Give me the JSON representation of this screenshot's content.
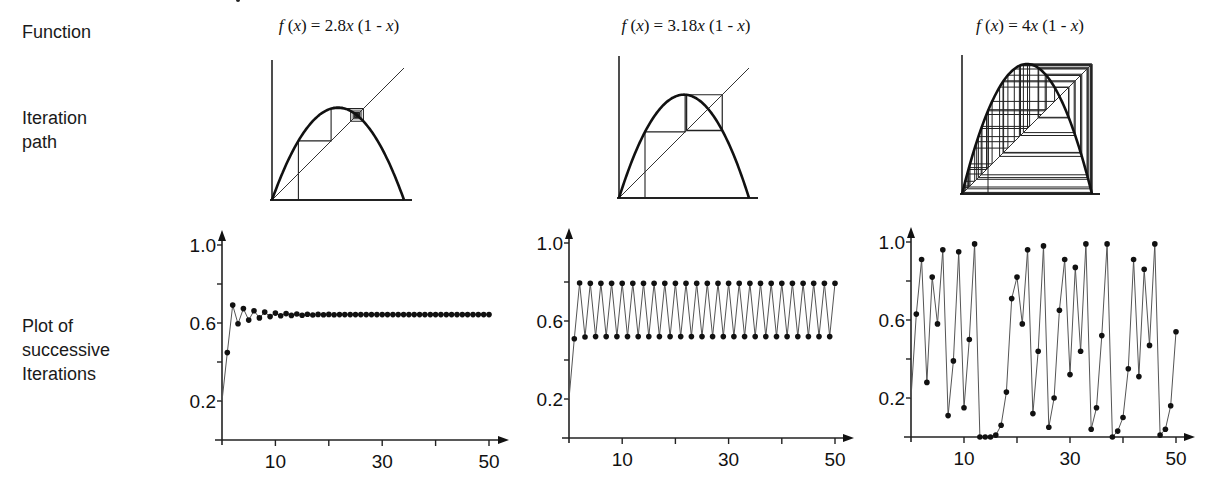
{
  "row_labels": {
    "function": "Function",
    "iteration_path": [
      "Iteration",
      "path"
    ],
    "successive_plot": [
      "Plot of",
      "successive",
      "Iterations"
    ]
  },
  "columns": [
    {
      "formula_prefix": "f (x) = ",
      "formula_coef": "2.8",
      "formula_suffix": "x (1 - x)",
      "r": 2.8
    },
    {
      "formula_prefix": "f (x) = ",
      "formula_coef": "3.18",
      "formula_suffix": "x (1 - x)",
      "r": 3.18
    },
    {
      "formula_prefix": "f (x) = ",
      "formula_coef": "4",
      "formula_suffix": "x (1 - x)",
      "r": 4
    }
  ],
  "chart_data": [
    {
      "type": "line",
      "title": "f(x) = 2.8x (1 - x)",
      "xlabel": "",
      "ylabel": "",
      "x": [
        0,
        1,
        2,
        3,
        4,
        5,
        6,
        7,
        8,
        9,
        10,
        11,
        12,
        13,
        14,
        15,
        16,
        17,
        18,
        19,
        20,
        21,
        22,
        23,
        24,
        25,
        26,
        27,
        28,
        29,
        30,
        31,
        32,
        33,
        34,
        35,
        36,
        37,
        38,
        39,
        40,
        41,
        42,
        43,
        44,
        45,
        46,
        47,
        48,
        49,
        50
      ],
      "values": [
        0.2,
        0.448,
        0.692,
        0.596,
        0.674,
        0.615,
        0.663,
        0.626,
        0.656,
        0.633,
        0.651,
        0.637,
        0.648,
        0.639,
        0.646,
        0.64,
        0.645,
        0.641,
        0.644,
        0.642,
        0.644,
        0.642,
        0.643,
        0.643,
        0.643,
        0.643,
        0.643,
        0.643,
        0.643,
        0.643,
        0.643,
        0.643,
        0.643,
        0.643,
        0.643,
        0.643,
        0.643,
        0.643,
        0.643,
        0.643,
        0.643,
        0.643,
        0.643,
        0.643,
        0.643,
        0.643,
        0.643,
        0.643,
        0.643,
        0.643,
        0.643
      ],
      "x_ticks": [
        10,
        20,
        30,
        40,
        50
      ],
      "x_tick_labels": [
        "10",
        "30",
        "50"
      ],
      "y_ticks": [
        0.2,
        0.4,
        0.6,
        0.8,
        1.0
      ],
      "y_tick_labels": [
        "0.2",
        "0.6",
        "1.0"
      ],
      "xlim": [
        0,
        50
      ],
      "ylim": [
        0,
        1.0
      ],
      "grid": false,
      "markers": true
    },
    {
      "type": "line",
      "title": "f(x) = 3.18x (1 - x)",
      "xlabel": "",
      "ylabel": "",
      "x": [
        0,
        1,
        2,
        3,
        4,
        5,
        6,
        7,
        8,
        9,
        10,
        11,
        12,
        13,
        14,
        15,
        16,
        17,
        18,
        19,
        20,
        21,
        22,
        23,
        24,
        25,
        26,
        27,
        28,
        29,
        30,
        31,
        32,
        33,
        34,
        35,
        36,
        37,
        38,
        39,
        40,
        41,
        42,
        43,
        44,
        45,
        46,
        47,
        48,
        49,
        50
      ],
      "values": [
        0.2,
        0.509,
        0.795,
        0.518,
        0.794,
        0.52,
        0.794,
        0.52,
        0.794,
        0.52,
        0.794,
        0.52,
        0.794,
        0.52,
        0.794,
        0.52,
        0.794,
        0.52,
        0.794,
        0.52,
        0.794,
        0.52,
        0.794,
        0.52,
        0.794,
        0.52,
        0.794,
        0.52,
        0.794,
        0.52,
        0.794,
        0.52,
        0.794,
        0.52,
        0.794,
        0.52,
        0.794,
        0.52,
        0.794,
        0.52,
        0.794,
        0.52,
        0.794,
        0.52,
        0.794,
        0.52,
        0.794,
        0.52,
        0.794,
        0.52,
        0.794
      ],
      "x_ticks": [
        10,
        20,
        30,
        40,
        50
      ],
      "x_tick_labels": [
        "10",
        "30",
        "50"
      ],
      "y_ticks": [
        0.2,
        0.4,
        0.6,
        0.8,
        1.0
      ],
      "y_tick_labels": [
        "0.2",
        "0.6",
        "1.0"
      ],
      "xlim": [
        0,
        50
      ],
      "ylim": [
        0,
        1.0
      ],
      "grid": false,
      "markers": true
    },
    {
      "type": "line",
      "title": "f(x) = 4x (1 - x)",
      "xlabel": "",
      "ylabel": "",
      "x": [
        0,
        1,
        2,
        3,
        4,
        5,
        6,
        7,
        8,
        9,
        10,
        11,
        12,
        13,
        14,
        15,
        16,
        17,
        18,
        19,
        20,
        21,
        22,
        23,
        24,
        25,
        26,
        27,
        28,
        29,
        30,
        31,
        32,
        33,
        34,
        35,
        36,
        37,
        38,
        39,
        40,
        41,
        42,
        43,
        44,
        45,
        46,
        47,
        48,
        49,
        50
      ],
      "values": [
        0.2,
        0.63,
        0.91,
        0.28,
        0.82,
        0.58,
        0.96,
        0.11,
        0.39,
        0.95,
        0.15,
        0.5,
        0.99,
        0.0,
        0.0,
        0.0,
        0.01,
        0.06,
        0.23,
        0.71,
        0.82,
        0.58,
        0.96,
        0.12,
        0.44,
        0.98,
        0.05,
        0.2,
        0.65,
        0.91,
        0.32,
        0.87,
        0.44,
        0.99,
        0.04,
        0.15,
        0.52,
        0.99,
        0.0,
        0.03,
        0.1,
        0.35,
        0.91,
        0.31,
        0.86,
        0.47,
        0.99,
        0.01,
        0.04,
        0.16,
        0.54
      ],
      "x_ticks": [
        10,
        20,
        30,
        40,
        50
      ],
      "x_tick_labels": [
        "10",
        "30",
        "50"
      ],
      "y_ticks": [
        0.2,
        0.4,
        0.6,
        0.8,
        1.0
      ],
      "y_tick_labels": [
        "0.2",
        "0.6",
        "1.0"
      ],
      "xlim": [
        0,
        50
      ],
      "ylim": [
        0,
        1.0
      ],
      "grid": false,
      "markers": true
    }
  ],
  "iteration_paths": [
    {
      "r": 2.8,
      "x0": 0.2,
      "steps": 40
    },
    {
      "r": 3.18,
      "x0": 0.2,
      "steps": 40
    },
    {
      "r": 4,
      "x0": 0.2,
      "steps": 50
    }
  ]
}
